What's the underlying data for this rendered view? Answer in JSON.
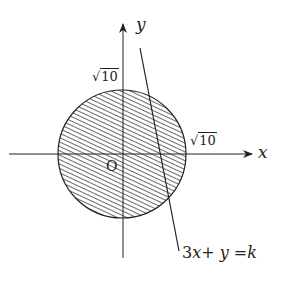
{
  "diagram": {
    "type": "coordinate-plane",
    "colors": {
      "stroke": "#222222",
      "hatch": "#444444",
      "background": "#ffffff"
    },
    "axes": {
      "x_label": "x",
      "y_label": "y",
      "origin_label": "O"
    },
    "circle": {
      "radius_label_x": "10",
      "radius_label_y": "10",
      "radical_symbol": "√",
      "fill": "hatched",
      "equation_radius": "√10"
    },
    "line": {
      "equation_parts": [
        "3",
        "x",
        "+ ",
        "y",
        " =",
        "k"
      ]
    }
  }
}
